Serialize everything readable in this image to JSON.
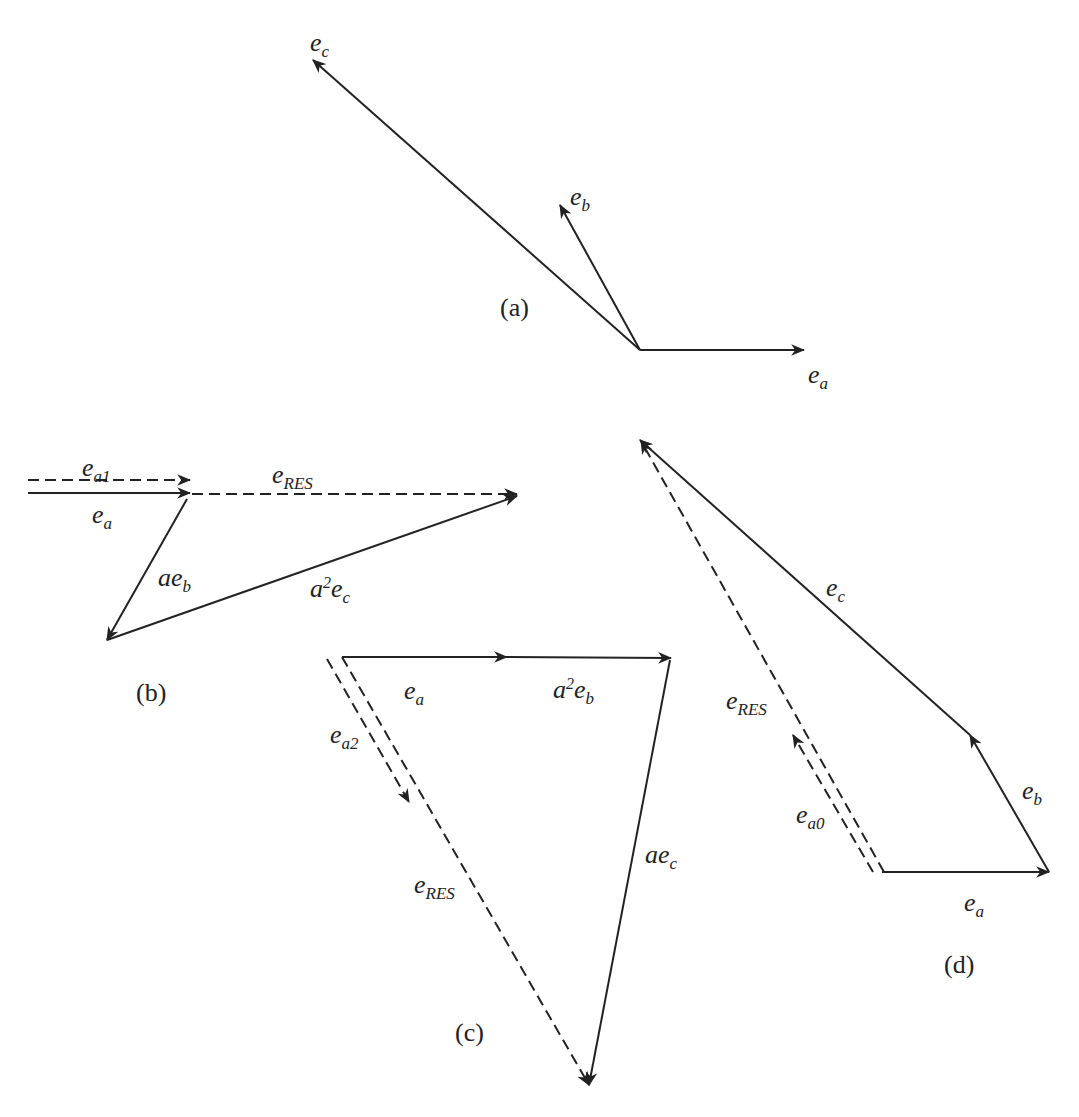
{
  "diagram": {
    "style": {
      "stroke_color": "#222222",
      "background": "#ffffff"
    },
    "panels": [
      {
        "id": "a",
        "caption": "(a)",
        "caption_pos": [
          500,
          295
        ],
        "vectors": [
          {
            "name": "e_a",
            "from": [
              640,
              350
            ],
            "to": [
              804,
              350
            ],
            "dashed": false,
            "label": {
              "base": "e",
              "sub": "a",
              "sup": "",
              "coef": "",
              "pos": [
                808,
                362
              ]
            }
          },
          {
            "name": "e_b",
            "from": [
              640,
              350
            ],
            "to": [
              560,
              205
            ],
            "dashed": false,
            "label": {
              "base": "e",
              "sub": "b",
              "sup": "",
              "coef": "",
              "pos": [
                570,
                184
              ]
            }
          },
          {
            "name": "e_c",
            "from": [
              640,
              350
            ],
            "to": [
              313,
              60
            ],
            "dashed": false,
            "label": {
              "base": "e",
              "sub": "c",
              "sup": "",
              "coef": "",
              "pos": [
                310,
                30
              ]
            }
          }
        ]
      },
      {
        "id": "b",
        "caption": "(b)",
        "caption_pos": [
          136,
          680
        ],
        "vectors": [
          {
            "name": "e_a1",
            "from": [
              28,
              480
            ],
            "to": [
              190,
              480
            ],
            "dashed": true,
            "label": {
              "base": "e",
              "sub": "a1",
              "sup": "",
              "coef": "",
              "pos": [
                82,
                455
              ]
            }
          },
          {
            "name": "e_a",
            "from": [
              28,
              493
            ],
            "to": [
              190,
              493
            ],
            "dashed": false,
            "label": {
              "base": "e",
              "sub": "a",
              "sup": "",
              "coef": "",
              "pos": [
                92,
                502
              ]
            }
          },
          {
            "name": "e_RES",
            "from": [
              192,
              494
            ],
            "to": [
              517,
              494
            ],
            "dashed": true,
            "label": {
              "base": "e",
              "sub": "RES",
              "sup": "",
              "coef": "",
              "pos": [
                272,
                462
              ]
            }
          },
          {
            "name": "ae_b",
            "from": [
              187,
              499
            ],
            "to": [
              107,
              640
            ],
            "dashed": false,
            "label": {
              "base": "e",
              "sub": "b",
              "sup": "",
              "coef": "a",
              "pos": [
                158,
                565
              ]
            }
          },
          {
            "name": "a2e_c",
            "from": [
              107,
              640
            ],
            "to": [
              517,
              496
            ],
            "dashed": false,
            "label": {
              "base": "e",
              "sub": "c",
              "sup": "2",
              "coef": "a",
              "pos": [
                310,
                575
              ]
            }
          }
        ]
      },
      {
        "id": "c",
        "caption": "(c)",
        "caption_pos": [
          455,
          1020
        ],
        "vectors": [
          {
            "name": "e_a",
            "from": [
              342,
              657
            ],
            "to": [
              507,
              657
            ],
            "dashed": false,
            "label": {
              "base": "e",
              "sub": "a",
              "sup": "",
              "coef": "",
              "pos": [
                404,
                678
              ]
            }
          },
          {
            "name": "a2e_b",
            "from": [
              507,
              657
            ],
            "to": [
              671,
              658
            ],
            "dashed": false,
            "label": {
              "base": "e",
              "sub": "b",
              "sup": "2",
              "coef": "a",
              "pos": [
                553,
                676
              ]
            }
          },
          {
            "name": "ae_c",
            "from": [
              670,
              660
            ],
            "to": [
              589,
              1085
            ],
            "dashed": false,
            "label": {
              "base": "e",
              "sub": "c",
              "sup": "",
              "coef": "a",
              "pos": [
                645,
                842
              ]
            }
          },
          {
            "name": "e_RES",
            "from": [
              342,
              657
            ],
            "to": [
              589,
              1085
            ],
            "dashed": true,
            "label": {
              "base": "e",
              "sub": "RES",
              "sup": "",
              "coef": "",
              "pos": [
                414,
                872
              ]
            }
          },
          {
            "name": "e_a2",
            "from": [
              327,
              659
            ],
            "to": [
              409,
              802
            ],
            "dashed": true,
            "label": {
              "base": "e",
              "sub": "a2",
              "sup": "",
              "coef": "",
              "pos": [
                330,
                722
              ]
            }
          }
        ]
      },
      {
        "id": "d",
        "caption": "(d)",
        "caption_pos": [
          944,
          952
        ],
        "vectors": [
          {
            "name": "e_a",
            "from": [
              882,
              872
            ],
            "to": [
              1049,
              872
            ],
            "dashed": false,
            "label": {
              "base": "e",
              "sub": "a",
              "sup": "",
              "coef": "",
              "pos": [
                964,
                890
              ]
            }
          },
          {
            "name": "e_b",
            "from": [
              1049,
              872
            ],
            "to": [
              970,
              735
            ],
            "dashed": false,
            "label": {
              "base": "e",
              "sub": "b",
              "sup": "",
              "coef": "",
              "pos": [
                1022,
                778
              ]
            }
          },
          {
            "name": "e_c",
            "from": [
              970,
              735
            ],
            "to": [
              640,
              440
            ],
            "dashed": false,
            "label": {
              "base": "e",
              "sub": "c",
              "sup": "",
              "coef": "",
              "pos": [
                826,
                575
              ]
            }
          },
          {
            "name": "e_RES",
            "from": [
              884,
              872
            ],
            "to": [
              641,
              441
            ],
            "dashed": true,
            "label": {
              "base": "e",
              "sub": "RES",
              "sup": "",
              "coef": "",
              "pos": [
                726,
                688
              ]
            }
          },
          {
            "name": "e_a0",
            "from": [
              873,
              872
            ],
            "to": [
              793,
              735
            ],
            "dashed": true,
            "label": {
              "base": "e",
              "sub": "a0",
              "sup": "",
              "coef": "",
              "pos": [
                796,
                802
              ]
            }
          }
        ]
      }
    ]
  }
}
